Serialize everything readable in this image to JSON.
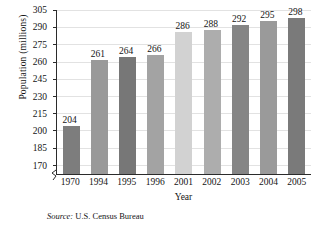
{
  "chart_data": {
    "type": "bar",
    "title": "",
    "xlabel": "Year",
    "ylabel": "Population (millions)",
    "categories": [
      "1970",
      "1994",
      "1995",
      "1996",
      "2001",
      "2002",
      "2003",
      "2004",
      "2005"
    ],
    "values": [
      204,
      261,
      264,
      266,
      286,
      288,
      292,
      295,
      298
    ],
    "value_labels": [
      "204",
      "261",
      "264",
      "266",
      "286",
      "288",
      "292",
      "295",
      "298"
    ],
    "bar_colors": [
      "#7d7d7d",
      "#999999",
      "#777777",
      "#a3a3a3",
      "#d2d2d2",
      "#adadad",
      "#858585",
      "#9a9a9a",
      "#7a7a7a"
    ],
    "yticks": [
      170,
      185,
      200,
      215,
      230,
      245,
      260,
      275,
      290,
      305
    ],
    "ytick_labels": [
      "170",
      "185",
      "200",
      "215",
      "230",
      "245",
      "260",
      "275",
      "290",
      "305"
    ],
    "ylim": [
      162,
      305
    ],
    "axis_break": true,
    "grid": "horizontal",
    "legend": "none"
  },
  "source": {
    "prefix": "Source:",
    "text": "U.S. Census Bureau"
  },
  "colors": {
    "axis": "#2b2b2b",
    "gridline": "#e2e2e2",
    "text": "#141414",
    "background": "#ffffff"
  }
}
